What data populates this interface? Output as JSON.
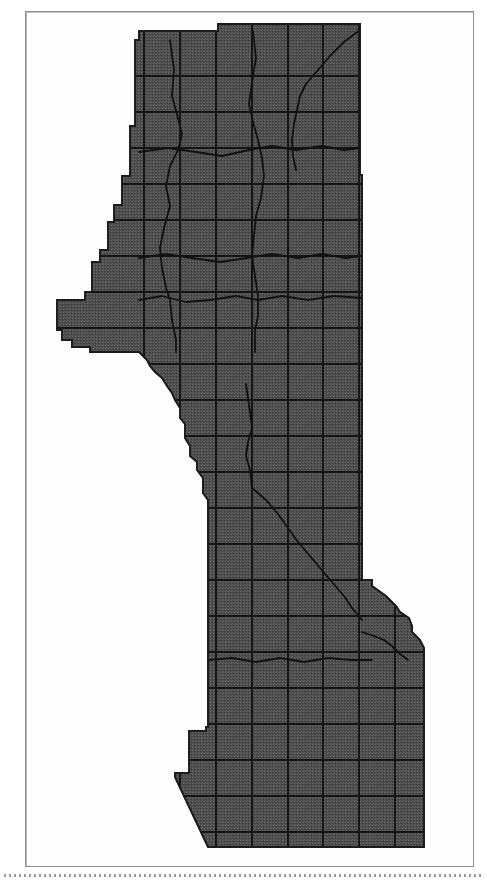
{
  "figure": {
    "kind": "scanned-map-figure",
    "caption": "",
    "title": "",
    "has_labels": false,
    "has_legend": false,
    "has_scale_bar": false,
    "has_north_arrow": false
  },
  "page": {
    "width_px": 487,
    "height_px": 885,
    "background_color": "#ffffff",
    "frame": {
      "visible": true,
      "left_px": 25,
      "top_px": 11,
      "width_px": 449,
      "height_px": 856,
      "line_color": "#8d8d8d"
    },
    "bottom_rule": {
      "visible": true,
      "style": "dotted",
      "top_px": 874,
      "color": "#9a9a9a"
    }
  },
  "map": {
    "region_fill_color": "#4d4d4d",
    "region_fill_texture": "halftone-dither",
    "region_outline_color": "#1a1a1a",
    "grid_line_color": "#151515",
    "boundary_line_color": "#111111",
    "road_line_color": "#1a1a1a",
    "orientation": "north-up",
    "grid": {
      "description": "township-and-range survey grid",
      "spacing_px": 36,
      "vertical_line_x": [
        144,
        180,
        216,
        252,
        288,
        323,
        359,
        395,
        431
      ],
      "horizontal_line_y": [
        76,
        112,
        148,
        184,
        220,
        256,
        292,
        328,
        364,
        400,
        436,
        472,
        508,
        544,
        580,
        616,
        652,
        688,
        724,
        760,
        796,
        832
      ]
    },
    "shaded_region": {
      "name": "study-area-polygon",
      "outline_points": "139,40 139,31 218,31 218,24 360,24 360,175 362,175 362,580 372,580 372,586 386,596 396,606 400,612 409,618 412,626 412,632 420,640 424,648 424,667 424,847 245,847 208,847 175,777 175,773 189,773 189,731 206,731 206,727 208,727 208,500 203,493 203,478 197,470 197,462 190,456 190,446 185,438 185,424 180,418 180,408 175,400 172,393 167,386 162,378 155,372 150,366 147,360 143,356 139,352 90,352 90,347 72,347 72,340 62,340 62,330 57,330 57,300 85,300 85,292 92,292 92,262 100,262 100,250 108,250 108,222 114,222 114,205 122,205 122,176 130,176 130,126 135,126 135,40"
    },
    "internal_boundaries": [
      {
        "name": "boundary-west-vertical",
        "points": "170,40 174,70 172,96 178,118 182,134 178,150 170,166 166,186 170,206 164,228 160,248 162,268 166,288 170,300 172,320 176,340 176,352"
      },
      {
        "name": "boundary-north-center",
        "points": "253,31 256,58 252,82 249,104 253,122 258,140 262,158 264,176 261,198 256,216 254,236 252,256 255,276 258,296 258,316 255,330 255,352"
      },
      {
        "name": "boundary-northeast-diagonal",
        "points": "360,30 344,42 330,56 318,70 306,84 300,96 297,110 294,124 292,140 293,156 296,170"
      },
      {
        "name": "boundary-mid-horizontal-1",
        "points": "139,152 168,148 196,152 222,156 249,150 272,146 296,150 322,146 344,150 360,148"
      },
      {
        "name": "boundary-mid-horizontal-2",
        "points": "139,258 166,254 192,258 220,262 247,258 272,254 298,258 322,254 346,258 362,256"
      },
      {
        "name": "boundary-mid-horizontal-3",
        "points": "139,300 162,296 186,302 210,300 236,296 258,300 282,296 308,300 334,296 362,298"
      },
      {
        "name": "boundary-south-diagonal",
        "points": "252,488 266,500 278,514 288,528 298,542 310,556 320,568 332,582 344,596 352,608 362,620"
      },
      {
        "name": "boundary-south-branch",
        "points": "252,488 250,470 246,456 248,442 252,428 250,412 248,398 246,384"
      },
      {
        "name": "boundary-southeast-hook",
        "points": "362,632 374,636 384,640 392,646 400,654 408,660"
      },
      {
        "name": "boundary-lower-horizontal",
        "points": "208,660 232,658 256,662 280,658 304,662 328,658 352,660 372,660"
      }
    ]
  },
  "accessibility": {
    "figure_alt": "Black and white scanned map showing a shaded irregular region covered by a rectangular survey grid, with darker boundary and road lines crossing it."
  }
}
